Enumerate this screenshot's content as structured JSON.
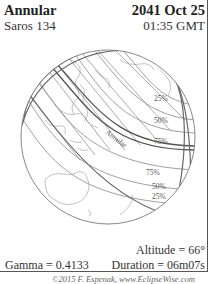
{
  "header": {
    "eclipse_type": "Annular",
    "saros": "Saros 134",
    "date": "2041 Oct 25",
    "time": "01:35 GMT"
  },
  "map": {
    "path_label": "Annular",
    "north_limit_labels": [
      "25%",
      "50%",
      "75%"
    ],
    "south_limit_labels": [
      "75%",
      "50%",
      "25%"
    ],
    "colors": {
      "line": "#777777",
      "coast": "#999999",
      "path": "#666666"
    }
  },
  "footer": {
    "altitude": "Altitude = 66°",
    "gamma": "Gamma = 0.4133",
    "duration": "Duration = 06m07s",
    "credit": "©2015 F. Espenak, www.EclipseWise.com"
  }
}
